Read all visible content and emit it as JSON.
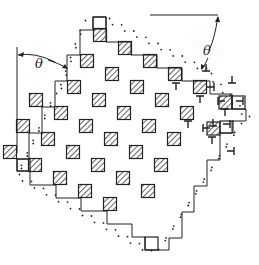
{
  "figure": {
    "angle_label": "θ",
    "colors": {
      "ink": "#222222",
      "background": "#ffffff"
    },
    "lattice": {
      "origin": [
        100,
        35
      ],
      "vec_a": [
        25,
        13
      ],
      "vec_b": [
        -13,
        26
      ],
      "square_size": 13,
      "sites": [
        [
          0,
          0
        ],
        [
          1,
          0
        ],
        [
          2,
          0
        ],
        [
          3,
          0
        ],
        [
          4,
          0
        ],
        [
          0,
          1
        ],
        [
          1,
          1
        ],
        [
          2,
          1
        ],
        [
          3,
          1
        ],
        [
          4,
          1
        ],
        [
          0,
          2
        ],
        [
          1,
          2
        ],
        [
          2,
          2
        ],
        [
          3,
          2
        ],
        [
          4,
          2
        ],
        [
          -1,
          3
        ],
        [
          0,
          3
        ],
        [
          1,
          3
        ],
        [
          2,
          3
        ],
        [
          3,
          3
        ],
        [
          4,
          3
        ],
        [
          -1,
          4
        ],
        [
          0,
          4
        ],
        [
          1,
          4
        ],
        [
          2,
          4
        ],
        [
          3,
          4
        ],
        [
          4,
          4
        ],
        [
          -1,
          5
        ],
        [
          0,
          5
        ],
        [
          1,
          5
        ],
        [
          2,
          5
        ],
        [
          3,
          5
        ]
      ]
    },
    "dislocations": [
      {
        "x": 176,
        "y": 83,
        "dir": "up"
      },
      {
        "x": 200,
        "y": 96,
        "dir": "up"
      },
      {
        "x": 206,
        "y": 71,
        "dir": "down"
      },
      {
        "x": 214,
        "y": 87,
        "dir": "left"
      },
      {
        "x": 225,
        "y": 109,
        "dir": "up"
      },
      {
        "x": 232,
        "y": 83,
        "dir": "down"
      },
      {
        "x": 218,
        "y": 101,
        "dir": "right"
      },
      {
        "x": 243,
        "y": 101,
        "dir": "left"
      },
      {
        "x": 213,
        "y": 126,
        "dir": "down"
      },
      {
        "x": 203,
        "y": 128,
        "dir": "right"
      },
      {
        "x": 230,
        "y": 124,
        "dir": "left"
      },
      {
        "x": 212,
        "y": 137,
        "dir": "up"
      },
      {
        "x": 188,
        "y": 121,
        "dir": "up"
      },
      {
        "x": 234,
        "y": 151,
        "dir": "left"
      }
    ],
    "angle_annotations": [
      {
        "label": "θ",
        "x": 33,
        "y": 66
      },
      {
        "label": "θ",
        "x": 205,
        "y": 50
      }
    ]
  }
}
